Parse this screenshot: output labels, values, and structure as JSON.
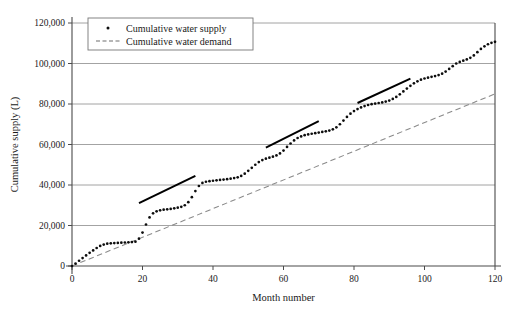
{
  "chart_data": {
    "type": "scatter",
    "title": "",
    "xlabel": "Month number",
    "ylabel": "Cumulative supply (L)",
    "xlim": [
      0,
      120
    ],
    "ylim": [
      0,
      120000
    ],
    "xticks": [
      0,
      20,
      40,
      60,
      80,
      100,
      120
    ],
    "xtick_labels": [
      "0",
      "20",
      "40",
      "60",
      "80",
      "100",
      "120"
    ],
    "yticks": [
      0,
      20000,
      40000,
      60000,
      80000,
      100000,
      120000
    ],
    "ytick_labels": [
      "0",
      "20,000",
      "40,000",
      "60,000",
      "80,000",
      "100,000",
      "120,000"
    ],
    "grid": "horizontal",
    "legend_position": "top-left-inside",
    "legend": [
      {
        "label": "Cumulative water supply",
        "marker": "dot",
        "color": "#0d0d0d"
      },
      {
        "label": "Cumulative water demand",
        "marker": "dashed-line",
        "color": "#6e6e6e"
      }
    ],
    "series": [
      {
        "name": "Cumulative water supply",
        "marker": "dot",
        "color": "#0d0d0d",
        "x": [
          0,
          1,
          2,
          3,
          4,
          5,
          6,
          7,
          8,
          9,
          10,
          11,
          12,
          13,
          14,
          15,
          16,
          17,
          18,
          19,
          20,
          21,
          22,
          23,
          24,
          25,
          26,
          27,
          28,
          29,
          30,
          31,
          32,
          33,
          34,
          35,
          36,
          37,
          38,
          39,
          40,
          41,
          42,
          43,
          44,
          45,
          46,
          47,
          48,
          49,
          50,
          51,
          52,
          53,
          54,
          55,
          56,
          57,
          58,
          59,
          60,
          61,
          62,
          63,
          64,
          65,
          66,
          67,
          68,
          69,
          70,
          71,
          72,
          73,
          74,
          75,
          76,
          77,
          78,
          79,
          80,
          81,
          82,
          83,
          84,
          85,
          86,
          87,
          88,
          89,
          90,
          91,
          92,
          93,
          94,
          95,
          96,
          97,
          98,
          99,
          100,
          101,
          102,
          103,
          104,
          105,
          106,
          107,
          108,
          109,
          110,
          111,
          112,
          113,
          114,
          115,
          116,
          117,
          118,
          119,
          120
        ],
        "y": [
          0,
          1200,
          2600,
          3900,
          5200,
          6500,
          7700,
          8900,
          9900,
          10600,
          11000,
          11200,
          11300,
          11400,
          11500,
          11600,
          11700,
          11800,
          12000,
          13500,
          16500,
          20500,
          24000,
          26000,
          27000,
          27500,
          27800,
          28000,
          28200,
          28500,
          28800,
          29200,
          30000,
          31500,
          34000,
          37000,
          39500,
          41000,
          41600,
          41900,
          42100,
          42300,
          42500,
          42700,
          42900,
          43100,
          43400,
          43800,
          44500,
          45600,
          47000,
          48500,
          50000,
          51300,
          52300,
          53000,
          53500,
          54000,
          54600,
          55600,
          57000,
          58800,
          60500,
          62000,
          63200,
          64000,
          64600,
          65000,
          65300,
          65600,
          65900,
          66200,
          66500,
          66900,
          67500,
          68500,
          70000,
          71800,
          73600,
          75200,
          76500,
          77500,
          78300,
          79000,
          79500,
          79900,
          80200,
          80500,
          80800,
          81200,
          81700,
          82500,
          83500,
          84800,
          86200,
          87600,
          89000,
          90200,
          91200,
          92000,
          92600,
          93000,
          93400,
          93800,
          94300,
          95000,
          96000,
          97300,
          98700,
          100000,
          100800,
          101400,
          102000,
          102800,
          104000,
          105600,
          107200,
          108500,
          109500,
          110200,
          110700
        ]
      },
      {
        "name": "Cumulative water demand",
        "marker": "dashed-line",
        "color": "#6e6e6e",
        "x": [
          0,
          120
        ],
        "y": [
          0,
          85000
        ]
      }
    ],
    "annotations": [
      {
        "type": "trend-segment",
        "x0": 19,
        "y0": 31000,
        "x1": 35,
        "y1": 44500
      },
      {
        "type": "trend-segment",
        "x0": 55,
        "y0": 58500,
        "x1": 70,
        "y1": 71500
      },
      {
        "type": "trend-segment",
        "x0": 81,
        "y0": 80500,
        "x1": 96,
        "y1": 92500
      }
    ]
  }
}
